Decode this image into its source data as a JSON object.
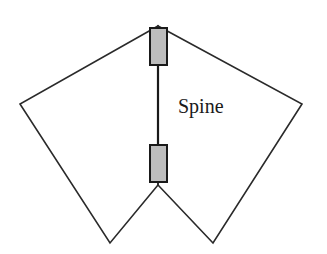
{
  "diagram": {
    "label": "Spine",
    "colors": {
      "stroke": "#2a2a2a",
      "block_fill": "#bdbdbd"
    },
    "elements": [
      "left-wing",
      "right-wing",
      "spine-line",
      "top-block",
      "bottom-block"
    ]
  }
}
